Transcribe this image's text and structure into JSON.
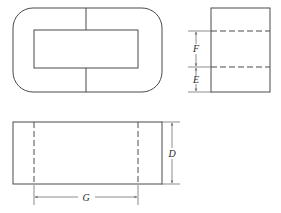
{
  "drawing": {
    "title": "Core cross-section three-view drawing",
    "line_color": "#4a4a4a",
    "dim_line_color": "#6e6e6e",
    "background_color": "#ffffff",
    "label_color": "#2a2a2a",
    "views": [
      {
        "name": "top-plan-view",
        "shape": "rounded-rectangle-with-window",
        "outer": {
          "x": 13,
          "y": 8,
          "width": 149,
          "height": 84,
          "corner_radius": 20
        },
        "window": {
          "x": 34,
          "y": 30,
          "width": 104,
          "height": 38
        },
        "center_line_x": 86
      },
      {
        "name": "right-side-view",
        "shape": "rectangle-with-hidden-lines",
        "outer": {
          "x": 211,
          "y": 8,
          "width": 59,
          "height": 84
        },
        "hidden_lines_y": [
          31,
          67
        ]
      },
      {
        "name": "bottom-front-view",
        "shape": "rectangle-with-hidden-lines",
        "outer": {
          "x": 13,
          "y": 122,
          "width": 149,
          "height": 62
        },
        "hidden_lines_x": [
          34,
          138
        ]
      }
    ],
    "dimensions": [
      {
        "id": "dimension-F",
        "label": "F",
        "orientation": "vertical",
        "view": "right-side-view",
        "axis_x": 196,
        "from": 31,
        "to": 67,
        "label_x": 196,
        "label_y": 49,
        "description": "Height between upper and lower hidden lines"
      },
      {
        "id": "dimension-E",
        "label": "E",
        "orientation": "vertical",
        "view": "right-side-view",
        "axis_x": 196,
        "from": 67,
        "to": 92,
        "label_x": 196,
        "label_y": 81,
        "description": "Height from lower hidden line to bottom edge"
      },
      {
        "id": "dimension-D",
        "label": "D",
        "orientation": "vertical",
        "view": "bottom-front-view",
        "axis_x": 172,
        "from": 122,
        "to": 184,
        "label_x": 172,
        "label_y": 154,
        "description": "Overall height of front view"
      },
      {
        "id": "dimension-G",
        "label": "G",
        "orientation": "horizontal",
        "view": "bottom-front-view",
        "axis_y": 197,
        "from": 34,
        "to": 138,
        "label_x": 86,
        "label_y": 197,
        "description": "Width between hidden lines in front view"
      }
    ]
  }
}
